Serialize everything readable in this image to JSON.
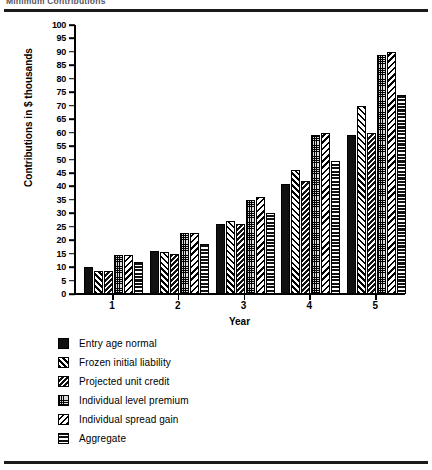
{
  "header": {
    "title": "Minimum Contributions"
  },
  "chart_data": {
    "type": "bar",
    "title": "Minimum Contributions",
    "xlabel": "Year",
    "ylabel": "Contributions in $ thousands",
    "ylim": [
      0,
      100
    ],
    "ytick_step": 5,
    "yticks": [
      "100",
      "95",
      "90",
      "85",
      "80",
      "75",
      "70",
      "65",
      "60",
      "55",
      "50",
      "45",
      "40",
      "35",
      "30",
      "25",
      "20",
      "15",
      "10",
      "5",
      "0"
    ],
    "categories": [
      "1",
      "2",
      "3",
      "4",
      "5"
    ],
    "grid": false,
    "legend_position": "below-plot",
    "series": [
      {
        "name": "Entry age normal",
        "pattern": "solid-black",
        "values": [
          10,
          16,
          26,
          41,
          59
        ]
      },
      {
        "name": "Frozen initial liability",
        "pattern": "diagonal-hatch-back",
        "values": [
          8.5,
          15.5,
          27,
          46,
          70
        ]
      },
      {
        "name": "Projected unit credit",
        "pattern": "diagonal-hatch-dark",
        "values": [
          8.5,
          15,
          26,
          42,
          60
        ]
      },
      {
        "name": "Individual level premium",
        "pattern": "stipple-dots",
        "values": [
          14.5,
          22.5,
          35,
          59,
          89
        ]
      },
      {
        "name": "Individual spread gain",
        "pattern": "diagonal-hatch-fwd",
        "values": [
          14.5,
          22.5,
          36,
          60,
          90
        ]
      },
      {
        "name": "Aggregate",
        "pattern": "horizontal-stripes",
        "values": [
          12,
          18.5,
          30,
          49.5,
          74
        ]
      }
    ]
  },
  "legend": {
    "items": [
      {
        "label": "Entry age normal"
      },
      {
        "label": "Frozen initial liability"
      },
      {
        "label": "Projected unit credit"
      },
      {
        "label": "Individual level premium"
      },
      {
        "label": "Individual spread gain"
      },
      {
        "label": "Aggregate"
      }
    ]
  }
}
